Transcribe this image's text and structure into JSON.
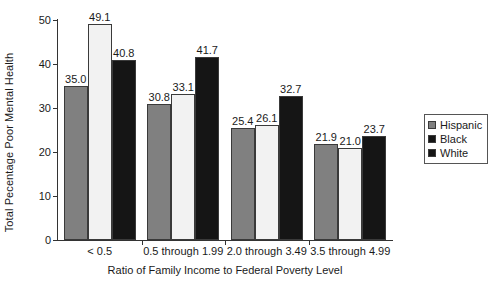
{
  "chart_data": {
    "type": "bar",
    "title": "",
    "xlabel": "Ratio of Family Income to Federal Poverty Level",
    "ylabel": "Total Pecentage Poor Mental Health",
    "categories": [
      "< 0.5",
      "0.5 through 1.99",
      "2.0 through 3.49",
      "3.5 through 4.99"
    ],
    "series": [
      {
        "name": "Hispanic",
        "color": "#808080",
        "values": [
          35.0,
          30.8,
          25.4,
          21.9
        ]
      },
      {
        "name": "Black",
        "color": "#f2f2f2",
        "values": [
          49.1,
          33.1,
          26.1,
          21.0
        ]
      },
      {
        "name": "White",
        "color": "#151515",
        "values": [
          40.8,
          41.7,
          32.7,
          23.7
        ]
      }
    ],
    "data_labels": [
      [
        "35.0",
        "49.1",
        "40.8"
      ],
      [
        "30.8",
        "33.1",
        "41.7"
      ],
      [
        "25.4",
        "26.1",
        "32.7"
      ],
      [
        "21.9",
        "21.0",
        "23.7"
      ]
    ],
    "ylim": [
      0,
      50
    ],
    "yticks": [
      0,
      10,
      20,
      30,
      40,
      50
    ],
    "ytick_labels": [
      "0",
      "10",
      "20",
      "30",
      "40",
      "50"
    ],
    "grid": false,
    "legend_position": "right",
    "legend_entries": [
      "Hispanic",
      "Black",
      "White"
    ]
  }
}
